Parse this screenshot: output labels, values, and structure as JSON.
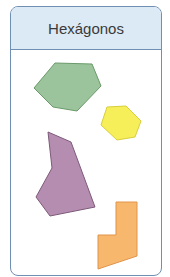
{
  "card": {
    "title": "Hexágonos"
  },
  "shapes": [
    {
      "name": "green-hexagon",
      "fill": "#9cc49c",
      "stroke": "#6a9a6a"
    },
    {
      "name": "yellow-hexagon",
      "fill": "#f6ef5a",
      "stroke": "#d8cf3a"
    },
    {
      "name": "purple-hexagon",
      "fill": "#b58db0",
      "stroke": "#7e5a7a"
    },
    {
      "name": "orange-hexagon",
      "fill": "#f7b86d",
      "stroke": "#e0944a"
    }
  ],
  "colors": {
    "border": "#6f8fb3",
    "header_bg": "#dceaf5"
  }
}
